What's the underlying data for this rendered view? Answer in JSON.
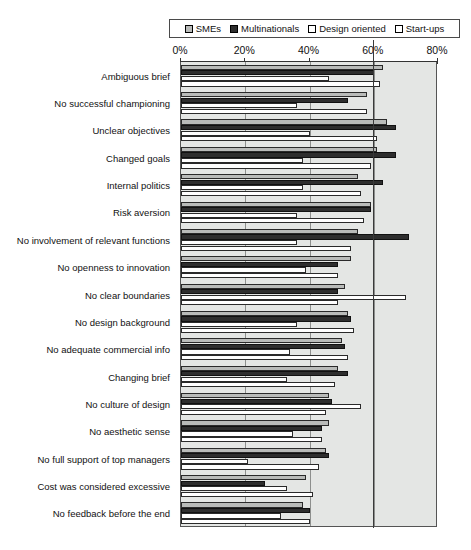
{
  "chart_data": {
    "type": "bar",
    "orientation": "horizontal",
    "title": "",
    "xlabel": "",
    "ylabel": "",
    "xlim": [
      0,
      80
    ],
    "xticks": [
      "0%",
      "20%",
      "40%",
      "60%",
      "80%"
    ],
    "xtick_values": [
      0,
      20,
      40,
      60,
      80
    ],
    "grid": true,
    "legend_position": "top",
    "legend": [
      "SMEs",
      "Multinationals",
      "Design oriented",
      "Start-ups"
    ],
    "series_colors": [
      "#b9bbb9",
      "#2e2e2e",
      "#ffffff",
      "#ffffff"
    ],
    "categories": [
      "Ambiguous brief",
      "No successful championing",
      "Unclear objectives",
      "Changed goals",
      "Internal politics",
      "Risk aversion",
      "No involvement of relevant functions",
      "No openness to innovation",
      "No clear boundaries",
      "No design background",
      "No adequate commercial info",
      "Changing brief",
      "No culture of design",
      "No aesthetic sense",
      "No full support of top managers",
      "Cost was considered excessive",
      "No feedback before the end"
    ],
    "series": [
      {
        "name": "SMEs",
        "values": [
          63,
          58,
          64,
          61,
          55,
          59,
          55,
          53,
          51,
          52,
          50,
          49,
          46,
          46,
          45,
          39,
          38
        ]
      },
      {
        "name": "Multinationals",
        "values": [
          60,
          52,
          67,
          67,
          63,
          59,
          71,
          49,
          49,
          53,
          51,
          52,
          47,
          44,
          46,
          26,
          40
        ]
      },
      {
        "name": "Design oriented",
        "values": [
          46,
          36,
          40,
          38,
          38,
          36,
          36,
          39,
          70,
          36,
          34,
          33,
          56,
          35,
          21,
          33,
          31
        ]
      },
      {
        "name": "Start-ups",
        "values": [
          62,
          58,
          61,
          59,
          56,
          57,
          53,
          49,
          49,
          54,
          52,
          48,
          45,
          44,
          43,
          41,
          40
        ]
      }
    ]
  },
  "legend": {
    "items": [
      {
        "label": "SMEs",
        "swatch": "#b9bbb9"
      },
      {
        "label": "Multinationals",
        "swatch": "#2e2e2e"
      },
      {
        "label": "Design oriented",
        "swatch": "#ffffff"
      },
      {
        "label": "Start-ups",
        "swatch": "#ffffff"
      }
    ]
  },
  "axis": {
    "ticks": [
      "0%",
      "20%",
      "40%",
      "60%",
      "80%"
    ]
  }
}
